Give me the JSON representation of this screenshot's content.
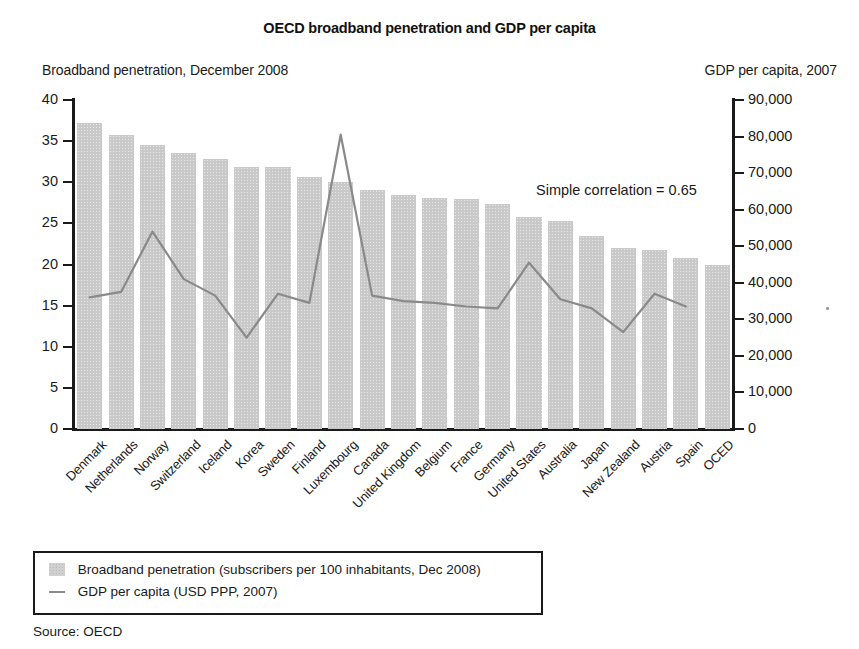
{
  "title": "OECD broadband penetration and GDP per capita",
  "left_axis_caption": "Broadband penetration, December 2008",
  "right_axis_caption": "GDP per capita, 2007",
  "annotation": "Simple correlation = 0.65",
  "source": "Source: OECD",
  "legend": {
    "bar_label": "Broadband penetration (subscribers per 100 inhabitants, Dec 2008)",
    "line_label": "GDP per capita (USD PPP, 2007)"
  },
  "colors": {
    "bar_fill": "#c9c9c9",
    "line": "#8a8a8a",
    "axis": "#1a1a1a",
    "text": "#1a1a1a"
  },
  "chart_data": {
    "type": "bar",
    "title": "OECD broadband penetration and GDP per capita",
    "xlabel": "",
    "ylabel": "Broadband penetration, December 2008",
    "y2label": "GDP per capita, 2007",
    "ylim": [
      0,
      40
    ],
    "y2lim": [
      0,
      90000
    ],
    "yticks": [
      "0",
      "5",
      "10",
      "15",
      "20",
      "25",
      "30",
      "35",
      "40"
    ],
    "ytick_values": [
      0,
      5,
      10,
      15,
      20,
      25,
      30,
      35,
      40
    ],
    "y2ticks": [
      "0",
      "10,000",
      "20,000",
      "30,000",
      "40,000",
      "50,000",
      "60,000",
      "70,000",
      "80,000",
      "90,000"
    ],
    "y2tick_values": [
      0,
      10000,
      20000,
      30000,
      40000,
      50000,
      60000,
      70000,
      80000,
      90000
    ],
    "grid": false,
    "legend_position": "below-plot",
    "annotations": [
      "Simple correlation = 0.65"
    ],
    "categories": [
      "Denmark",
      "Netherlands",
      "Norway",
      "Switzerland",
      "Iceland",
      "Korea",
      "Sweden",
      "Finland",
      "Luxembourg",
      "Canada",
      "United Kingdom",
      "Belgium",
      "France",
      "Germany",
      "United States",
      "Australia",
      "Japan",
      "New Zealand",
      "Austria",
      "Spain",
      "OCED"
    ],
    "series": [
      {
        "name": "Broadband penetration (subscribers per 100 inhabitants, Dec 2008)",
        "type": "bar",
        "axis": "left",
        "values": [
          37.2,
          35.8,
          34.5,
          33.6,
          32.8,
          31.9,
          31.9,
          30.6,
          30.0,
          29.0,
          28.5,
          28.1,
          28.0,
          27.4,
          25.8,
          25.3,
          23.5,
          22.0,
          21.8,
          20.8,
          20.0
        ]
      },
      {
        "name": "GDP per capita (USD PPP, 2007)",
        "type": "line",
        "axis": "right",
        "values": [
          36000,
          37500,
          54000,
          41000,
          36500,
          25000,
          37000,
          34500,
          80500,
          36500,
          35000,
          34500,
          33500,
          33000,
          45500,
          35500,
          33000,
          26500,
          37000,
          33500,
          null
        ]
      }
    ]
  }
}
